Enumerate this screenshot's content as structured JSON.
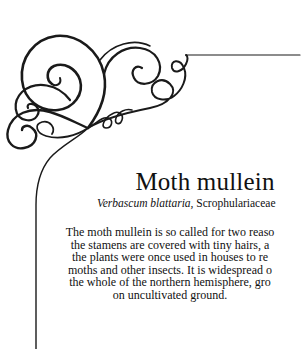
{
  "page": {
    "title": "Moth mullein",
    "subtitle": {
      "latin_name": "Verbascum blattaria,",
      "family": " Scrophulariaceae"
    },
    "body_lines": [
      "The moth mullein is so called for two reaso",
      "the stamens are covered with tiny hairs, a",
      "the plants were once used in houses to re",
      "moths and other insects. It is widespread o",
      "the whole of the northern hemisphere, gro",
      "on uncultivated ground."
    ]
  },
  "colors": {
    "ink": "#111111",
    "background": "#ffffff"
  },
  "decoration": {
    "ornament": "corner-flourish-icon"
  }
}
